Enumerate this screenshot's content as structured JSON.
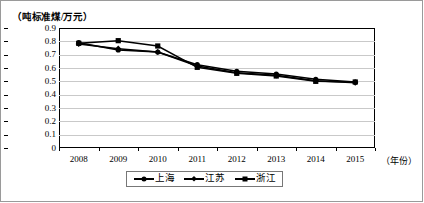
{
  "chart_data": {
    "type": "line",
    "title": "",
    "subtitle": "",
    "xlabel": "（年份）",
    "ylabel": "（吨标准煤/万元）",
    "categories": [
      "2008",
      "2009",
      "2010",
      "2011",
      "2012",
      "2013",
      "2014",
      "2015"
    ],
    "x": [
      2008,
      2009,
      2010,
      2011,
      2012,
      2013,
      2014,
      2015
    ],
    "ylim": [
      0,
      0.9
    ],
    "yticks": [
      "0",
      "0.1",
      "0.2",
      "0.3",
      "0.4",
      "0.5",
      "0.6",
      "0.7",
      "0.8",
      "0.9"
    ],
    "ytick_values": [
      0,
      0.1,
      0.2,
      0.3,
      0.4,
      0.5,
      0.6,
      0.7,
      0.8,
      0.9
    ],
    "grid": true,
    "legend_position": "bottom",
    "series": [
      {
        "name": "上海",
        "marker": "circle",
        "color": "#000000",
        "values": [
          0.79,
          0.735,
          0.72,
          0.625,
          0.575,
          0.555,
          0.515,
          0.495
        ]
      },
      {
        "name": "江苏",
        "marker": "diamond",
        "color": "#000000",
        "values": [
          0.78,
          0.745,
          0.72,
          0.615,
          0.565,
          0.545,
          0.505,
          0.49
        ]
      },
      {
        "name": "浙江",
        "marker": "square",
        "color": "#000000",
        "values": [
          0.785,
          0.805,
          0.765,
          0.605,
          0.56,
          0.54,
          0.5,
          0.495
        ]
      }
    ]
  },
  "axes": {
    "y_unit_caption": "（吨标准煤/万元）",
    "x_unit_caption": "（年份）"
  },
  "legend": {
    "items": [
      {
        "label": "上海",
        "marker": "circle-marker"
      },
      {
        "label": "江苏",
        "marker": "diamond-marker"
      },
      {
        "label": "浙江",
        "marker": "square-marker"
      }
    ]
  },
  "colors": {
    "series": "#000000",
    "grid": "#c9c9c9",
    "axis": "#000000",
    "frame": "#9a9a9a",
    "background": "#ffffff"
  }
}
